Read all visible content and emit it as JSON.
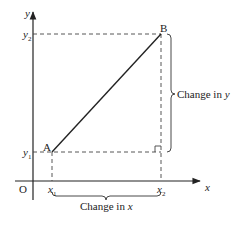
{
  "diagram": {
    "colors": {
      "line": "#222222",
      "dash": "#444444",
      "background": "#ffffff"
    },
    "axes": {
      "x_label": "x",
      "y_label": "y",
      "origin_label": "O"
    },
    "ticks": {
      "x1": "x",
      "x1_sub": "1",
      "x2": "x",
      "x2_sub": "2",
      "y1": "y",
      "y1_sub": "1",
      "y2": "y",
      "y2_sub": "2"
    },
    "points": {
      "A": "A",
      "B": "B"
    },
    "braces": {
      "change_x_text": "Change in ",
      "change_x_var": "x",
      "change_y_text": "Change in ",
      "change_y_var": "y"
    }
  }
}
